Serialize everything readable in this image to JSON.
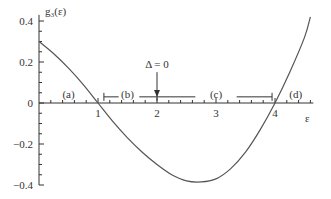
{
  "chart_data": {
    "type": "line",
    "title": "",
    "ylabel": "g₃(ε)",
    "xlabel": "ε",
    "xlim": [
      0,
      4.65
    ],
    "ylim": [
      -0.4,
      0.45
    ],
    "x_ticks": [
      1,
      2,
      3,
      4
    ],
    "y_ticks": [
      0.4,
      0.2,
      0,
      -0.2,
      -0.4
    ],
    "y_tick_labels": [
      "0.4",
      "0.2",
      "0",
      "−0.2",
      "−0.4"
    ],
    "grid": false,
    "legend": null,
    "series": [
      {
        "name": "g3(epsilon)",
        "x": [
          0,
          0.25,
          0.5,
          0.75,
          1.0,
          1.25,
          1.5,
          1.75,
          2.0,
          2.25,
          2.5,
          2.75,
          3.0,
          3.25,
          3.5,
          3.75,
          4.0,
          4.25,
          4.5,
          4.6
        ],
        "y": [
          0.3,
          0.24,
          0.17,
          0.09,
          0.0,
          -0.09,
          -0.17,
          -0.24,
          -0.3,
          -0.35,
          -0.38,
          -0.385,
          -0.37,
          -0.32,
          -0.24,
          -0.13,
          0.0,
          0.15,
          0.32,
          0.42
        ]
      }
    ],
    "annotations": [
      {
        "text": "Δ = 0",
        "x": 2,
        "y": 0.17,
        "arrow_to": [
          2,
          0.02
        ]
      },
      {
        "text": "(a)",
        "x": 0.5,
        "y": 0.025
      },
      {
        "text": "(b)",
        "x": 1.5,
        "y": 0.025
      },
      {
        "text": "(c)",
        "x": 3.0,
        "y": 0.025
      },
      {
        "text": "(d)",
        "x": 4.35,
        "y": 0.025
      }
    ],
    "intervals": [
      {
        "label": "(b)",
        "from": 1.1,
        "to": 2.65,
        "y": 0.03
      },
      {
        "label": "(c)",
        "from": 3.35,
        "to": 3.95,
        "y": 0.03
      }
    ]
  }
}
